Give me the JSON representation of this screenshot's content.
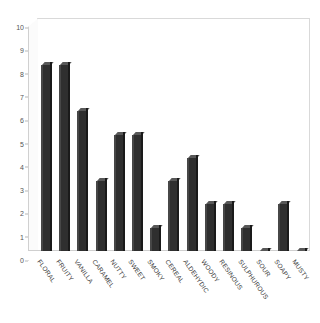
{
  "chart_data": {
    "type": "bar",
    "title": "",
    "subtitle": "",
    "xlabel": "",
    "ylabel": "",
    "ylim": [
      0,
      10
    ],
    "yticks": [
      0,
      1,
      2,
      3,
      4,
      5,
      6,
      7,
      8,
      9,
      10
    ],
    "grid": false,
    "legend": null,
    "style": "3d-column",
    "bar_color": "#2f2f2f",
    "categories": [
      "FLORAL",
      "FRUITY",
      "VANILLA",
      "CARAMEL",
      "NUTTY",
      "SWEET",
      "SMOKY",
      "CEREAL",
      "ALDEHYDIC",
      "WOODY",
      "RESINOUS",
      "SULPHUROUS",
      "SOUR",
      "SOAPY",
      "MUSTY"
    ],
    "values": [
      8,
      8,
      6,
      3,
      5,
      5,
      1,
      3,
      4,
      2,
      2,
      1,
      0,
      2,
      0
    ]
  }
}
